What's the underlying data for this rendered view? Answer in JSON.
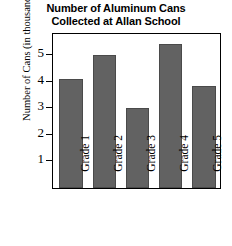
{
  "chart_data": {
    "type": "bar",
    "title": "Number of Aluminum Cans Collected at Allan School",
    "title_lines": [
      "Number of Aluminum Cans",
      "Collected at Allan School"
    ],
    "xlabel": "",
    "ylabel": "Number of Cans (in thousands)",
    "categories": [
      "Grade 1",
      "Grade 2",
      "Grade 3",
      "Grade 4",
      "Grade 5"
    ],
    "values": [
      4.1,
      5.0,
      3.0,
      5.4,
      3.85
    ],
    "ylim": [
      0,
      5.75
    ],
    "yticks": [
      1,
      2,
      3,
      4,
      5
    ],
    "ytick_labels": [
      "1",
      "2",
      "3",
      "4",
      "5"
    ],
    "grid": false,
    "legend": false,
    "bar_color": "#626262",
    "frame_color": "#000000",
    "background": "#ffffff"
  }
}
